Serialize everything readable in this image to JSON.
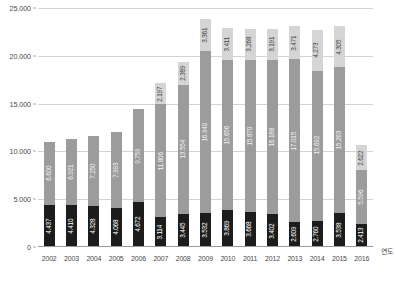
{
  "chart_data": {
    "type": "bar",
    "stacked": true,
    "title": "",
    "subtitle": "",
    "xlabel": "연도",
    "ylabel": "",
    "ylim": [
      0,
      25000
    ],
    "ytick_labels": [
      "0",
      "5.000",
      "10.000",
      "15.000",
      "20.000",
      "25.000"
    ],
    "ytick_values": [
      0,
      5000,
      10000,
      15000,
      20000,
      25000
    ],
    "grid": true,
    "legend": null,
    "categories": [
      "2002",
      "2003",
      "2004",
      "2005",
      "2006",
      "2007",
      "2008",
      "2009",
      "2010",
      "2011",
      "2012",
      "2013",
      "2014",
      "2015",
      "2016"
    ],
    "series": [
      {
        "name": "bottom-segment",
        "color": "#1c1c1c",
        "values": [
          4437,
          4410,
          4328,
          4068,
          4672,
          3114,
          3445,
          3532,
          3869,
          3668,
          3402,
          2609,
          2760,
          3538,
          2413
        ],
        "labels": [
          "4.437",
          "4.410",
          "4.328",
          "4.068",
          "4.672",
          "3.114",
          "3.445",
          "3.532",
          "3.869",
          "3.668",
          "3.402",
          "2.609",
          "2.760",
          "3.538",
          "2.413"
        ]
      },
      {
        "name": "middle-segment",
        "color": "#9c9c9c",
        "values": [
          6600,
          6921,
          7250,
          7993,
          9759,
          11806,
          13554,
          16940,
          15656,
          15870,
          16188,
          17015,
          15692,
          15263,
          5596
        ],
        "labels": [
          "6.600",
          "6.921",
          "7.250",
          "7.993",
          "9.759",
          "11.806",
          "13.554",
          "16.940",
          "15.656",
          "15.870",
          "16.188",
          "17.015",
          "15.692",
          "15.263",
          "5.596"
        ]
      },
      {
        "name": "top-segment",
        "color": "#d5d5d5",
        "values": [
          0,
          0,
          0,
          0,
          0,
          2197,
          2389,
          3361,
          3411,
          3268,
          3191,
          3471,
          4273,
          4305,
          2622
        ],
        "labels": [
          "",
          "",
          "",
          "",
          "",
          "2.197",
          "2.389",
          "3.361",
          "3.411",
          "3.268",
          "3.191",
          "3.471",
          "4.273",
          "4.305",
          "2.622"
        ]
      }
    ]
  }
}
